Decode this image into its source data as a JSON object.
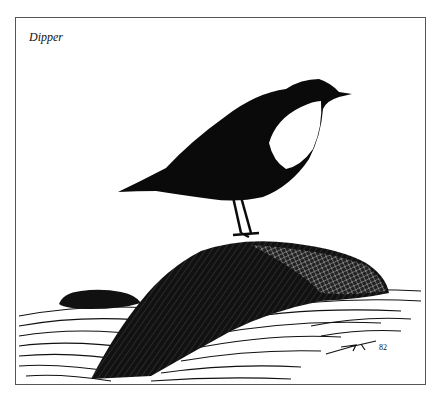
{
  "caption": "Dipper",
  "signature": "82",
  "colors": {
    "ink": "#0a0a0a",
    "paper": "#ffffff",
    "frame": "#555555"
  }
}
